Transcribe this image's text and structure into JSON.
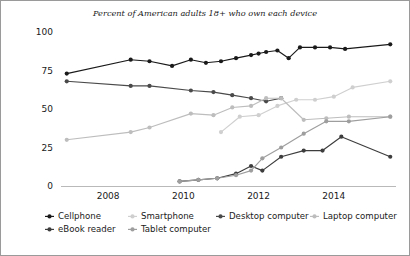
{
  "chart_data": {
    "type": "line",
    "title": "Percent of American adults 18+ who own each device",
    "xlabel": "",
    "ylabel": "",
    "xlim": [
      2006.8,
      2015.6
    ],
    "ylim": [
      0,
      100
    ],
    "xticks": [
      2008,
      2010,
      2012,
      2014
    ],
    "xtick_labels": [
      "2008",
      "2010",
      "2012",
      "2014"
    ],
    "yticks": [
      0,
      25,
      50,
      75,
      100
    ],
    "ytick_labels": [
      "0",
      "25",
      "50",
      "75",
      "100"
    ],
    "grid": false,
    "legend_position": "bottom-left",
    "series": [
      {
        "name": "Cellphone",
        "color": "#1a1a1a",
        "x": [
          2006.9,
          2008.6,
          2009.1,
          2009.7,
          2010.2,
          2010.6,
          2011.0,
          2011.4,
          2011.8,
          2012.0,
          2012.2,
          2012.5,
          2012.8,
          2013.1,
          2013.5,
          2013.9,
          2014.3,
          2015.5
        ],
        "y": [
          73,
          82,
          81,
          78,
          82,
          80,
          81,
          83,
          85,
          86,
          87,
          88,
          83,
          90,
          90,
          90,
          89,
          92
        ]
      },
      {
        "name": "Smartphone",
        "color": "#cfcfcf",
        "x": [
          2011.0,
          2011.5,
          2012.0,
          2012.5,
          2013.0,
          2013.5,
          2014.0,
          2014.5,
          2015.5
        ],
        "y": [
          35,
          45,
          46,
          52,
          56,
          56,
          58,
          64,
          68
        ]
      },
      {
        "name": "Desktop computer",
        "color": "#4a4a4a",
        "x": [
          2006.9,
          2008.6,
          2009.1,
          2010.2,
          2010.8,
          2011.3,
          2011.8,
          2012.2,
          2012.6
        ],
        "y": [
          68,
          65,
          65,
          62,
          61,
          59,
          57,
          55,
          57
        ]
      },
      {
        "name": "Laptop computer",
        "color": "#bdbdbd",
        "x": [
          2006.9,
          2008.6,
          2009.1,
          2010.2,
          2010.8,
          2011.3,
          2011.8,
          2012.2,
          2012.6,
          2013.2,
          2013.8,
          2014.4,
          2015.5
        ],
        "y": [
          30,
          35,
          38,
          47,
          46,
          51,
          52,
          57,
          57,
          43,
          44,
          45,
          45
        ]
      },
      {
        "name": "eBook reader",
        "color": "#3d3d3d",
        "x": [
          2009.9,
          2010.4,
          2010.9,
          2011.4,
          2011.8,
          2012.1,
          2012.6,
          2013.2,
          2013.7,
          2014.2,
          2015.5
        ],
        "y": [
          3,
          4,
          5,
          8,
          13,
          10,
          19,
          23,
          23,
          32,
          19
        ]
      },
      {
        "name": "Tablet computer",
        "color": "#9e9e9e",
        "x": [
          2009.9,
          2010.4,
          2010.9,
          2011.4,
          2011.8,
          2012.1,
          2012.6,
          2013.2,
          2013.8,
          2014.4,
          2015.5
        ],
        "y": [
          3,
          4,
          5,
          7,
          10,
          18,
          25,
          34,
          42,
          42,
          45
        ]
      }
    ]
  },
  "legend": {
    "items": [
      {
        "label": "Cellphone",
        "color": "#1a1a1a"
      },
      {
        "label": "Smartphone",
        "color": "#cfcfcf"
      },
      {
        "label": "Desktop computer",
        "color": "#4a4a4a"
      },
      {
        "label": "Laptop computer",
        "color": "#bdbdbd"
      },
      {
        "label": "eBook reader",
        "color": "#3d3d3d"
      },
      {
        "label": "Tablet computer",
        "color": "#9e9e9e"
      }
    ]
  }
}
